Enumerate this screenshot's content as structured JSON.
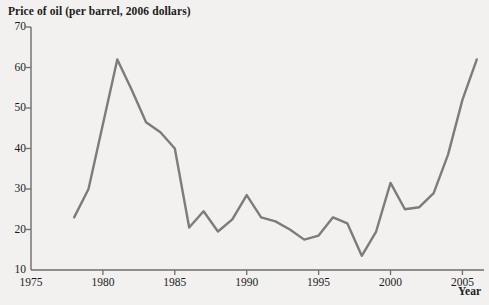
{
  "chart_data": {
    "type": "line",
    "title": "Price of oil (per barrel, 2006 dollars)",
    "xlabel": "Year",
    "ylabel": "",
    "xlim": [
      1975,
      2006.5
    ],
    "ylim": [
      10,
      70
    ],
    "grid": false,
    "legend": false,
    "line_color": "#7d7c7a",
    "background_color": "#f2f1ef",
    "axis_color": "#6e6d6b",
    "text_color": "#1b1b1b",
    "xticks": [
      1975,
      1980,
      1985,
      1990,
      1995,
      2000,
      2005
    ],
    "xtick_labels": [
      "1975",
      "1980",
      "1985",
      "1990",
      "1995",
      "2000",
      "2005"
    ],
    "yticks": [
      10,
      20,
      30,
      40,
      50,
      60,
      70
    ],
    "ytick_labels": [
      "10",
      "20",
      "30",
      "40",
      "50",
      "60",
      "70"
    ],
    "x": [
      1978,
      1979,
      1980,
      1981,
      1982,
      1983,
      1984,
      1985,
      1986,
      1987,
      1988,
      1989,
      1990,
      1991,
      1992,
      1993,
      1994,
      1995,
      1996,
      1997,
      1998,
      1999,
      2000,
      2001,
      2002,
      2003,
      2004,
      2005,
      2006
    ],
    "values": [
      23.0,
      30.0,
      46.0,
      62.0,
      54.5,
      46.5,
      44.0,
      40.0,
      20.5,
      24.5,
      19.5,
      22.5,
      28.5,
      23.0,
      22.0,
      20.0,
      17.5,
      18.5,
      23.0,
      21.5,
      13.5,
      19.5,
      31.5,
      25.0,
      25.5,
      29.0,
      38.5,
      52.0,
      62.0
    ],
    "series": [
      {
        "name": "Price of oil (per barrel, 2006 dollars)",
        "values": [
          23.0,
          30.0,
          46.0,
          62.0,
          54.5,
          46.5,
          44.0,
          40.0,
          20.5,
          24.5,
          19.5,
          22.5,
          28.5,
          23.0,
          22.0,
          20.0,
          17.5,
          18.5,
          23.0,
          21.5,
          13.5,
          19.5,
          31.5,
          25.0,
          25.5,
          29.0,
          38.5,
          52.0,
          62.0
        ]
      }
    ]
  }
}
